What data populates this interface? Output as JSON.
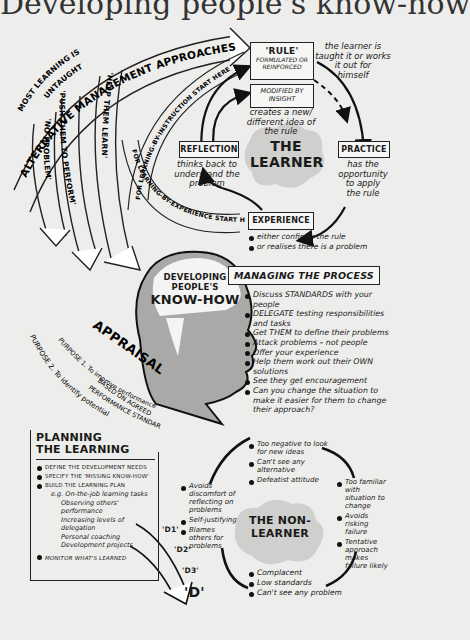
{
  "title": "Developing people's know-how",
  "most_learning_untaught": [
    "MOST LEARNING IS",
    "UNTAUGHT"
  ],
  "approaches": {
    "heading": "ALTERNATIVE MANAGEMENT APPROACHES",
    "branches": [
      "'NO PROBLEM'",
      "'PUSH THEM TO PERFORM'",
      "'HELP THEM LEARN'"
    ]
  },
  "learning_paths": {
    "instruction": "FOR LEARNING-BY-INSTRUCTION  START HERE",
    "experience": "FOR LEARNING-BY-EXPERIENCE  START HERE"
  },
  "learner_cycle": {
    "center": [
      "THE",
      "LEARNER"
    ],
    "rule": {
      "title": "'RULE'",
      "subtitle": [
        "FORMULATED OR",
        "REINFORCED"
      ],
      "note": [
        "the learner is",
        "taught it or works",
        "it out for",
        "himself"
      ]
    },
    "modified": {
      "title": [
        "MODIFIED BY",
        "INSIGHT"
      ],
      "note": [
        "creates a new/",
        "different idea of",
        "the rule"
      ]
    },
    "practice": {
      "title": "PRACTICE",
      "note": [
        "has the",
        "opportunity",
        "to apply",
        "the rule"
      ]
    },
    "reflection": {
      "title": "REFLECTION",
      "note": [
        "thinks back to",
        "understand the",
        "problem"
      ]
    },
    "experience": {
      "title": "EXPERIENCE",
      "bullets": [
        "either confirms the rule",
        "or realises there is a problem"
      ]
    }
  },
  "head": {
    "line1": "DEVELOPING",
    "line2": "PEOPLE'S",
    "line3": "KNOW-HOW"
  },
  "appraisal": {
    "heading": "APPRAISAL",
    "purpose1": [
      "PURPOSE 1. To improve performance",
      "BASED ON AGREED",
      "PERFORMANCE STANDARDS"
    ],
    "purpose2": "PURPOSE 2. To identify potential"
  },
  "managing": {
    "heading": "MANAGING THE PROCESS",
    "items": [
      "Discuss STANDARDS with your people",
      "DELEGATE testing responsibilities and tasks",
      "Get THEM to define their problems",
      "Attack problems – not people",
      "Offer your experience",
      "Help them work out their OWN solutions",
      "See they get encouragement",
      "Can you change the situation to make it easier for them to change their approach?"
    ]
  },
  "planning": {
    "heading": [
      "PLANNING",
      "THE LEARNING"
    ],
    "items": [
      "DEFINE THE DEVELOPMENT NEEDS",
      "SPECIFY THE 'MISSING KNOW-HOW'",
      "BUILD THE LEARNING PLAN"
    ],
    "eg": "e.g. On-the-job learning tasks",
    "tasks": [
      "Observing others' performance",
      "Increasing levels of delegation",
      "Personal coaching",
      "Development projects"
    ],
    "monitor": "MONITOR WHAT'S LEARNED"
  },
  "d_labels": [
    "'D1'",
    "'D2'",
    "'D3'",
    "'D'"
  ],
  "non_learner": {
    "center": [
      "THE NON-",
      "LEARNER"
    ],
    "top": [
      "Too negative to look for new ideas",
      "Can't see any alternative",
      "Defeatist attitude"
    ],
    "left": [
      "Avoids discomfort of reflecting on problems",
      "Self-justifying",
      "Blames others for problems"
    ],
    "right": [
      "Too familiar with situation to change",
      "Avoids risking failure",
      "Tentative approach makes failure likely"
    ],
    "bottom": [
      "Complacent",
      "Low standards",
      "Can't see any problem"
    ]
  },
  "colors": {
    "paper": "#ededeb",
    "ink": "#1a1a1a",
    "shade": "#c4c4c2",
    "head_shade": "#a9a9a7"
  }
}
